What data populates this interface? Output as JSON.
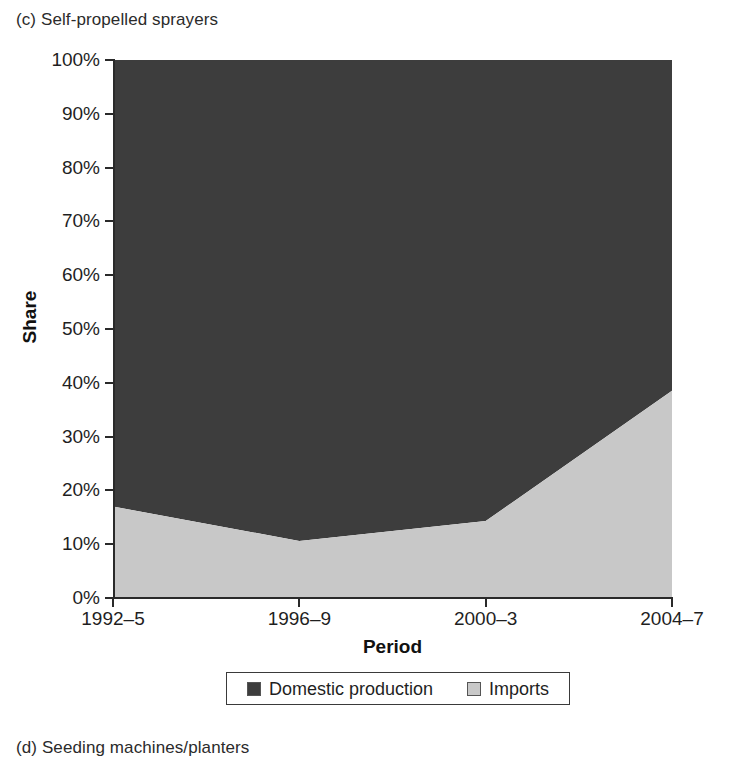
{
  "captions": {
    "top": "(c) Self-propelled sprayers",
    "bottom": "(d) Seeding machines/planters"
  },
  "colors": {
    "domestic": "#3d3d3d",
    "imports": "#c8c8c8",
    "axis": "#2a2a2a",
    "background": "#ffffff"
  },
  "chart_data": {
    "type": "area",
    "stacked": true,
    "percent_stacked": true,
    "title": "(c) Self-propelled sprayers",
    "xlabel": "Period",
    "ylabel": "Share",
    "categories": [
      "1992–5",
      "1996–9",
      "2000–3",
      "2004–7"
    ],
    "series": [
      {
        "name": "Imports",
        "color": "#c8c8c8",
        "values": [
          17,
          10.6,
          14.3,
          38.5
        ]
      },
      {
        "name": "Domestic production",
        "color": "#3d3d3d",
        "values": [
          83,
          89.4,
          85.7,
          61.5
        ]
      }
    ],
    "legend_order": [
      "Domestic production",
      "Imports"
    ],
    "legend_position": "bottom",
    "grid": false,
    "ylim": [
      0,
      100
    ],
    "ytick_values": [
      0,
      10,
      20,
      30,
      40,
      50,
      60,
      70,
      80,
      90,
      100
    ],
    "ytick_labels": [
      "0%",
      "10%",
      "20%",
      "30%",
      "40%",
      "50%",
      "60%",
      "70%",
      "80%",
      "90%",
      "100%"
    ]
  }
}
